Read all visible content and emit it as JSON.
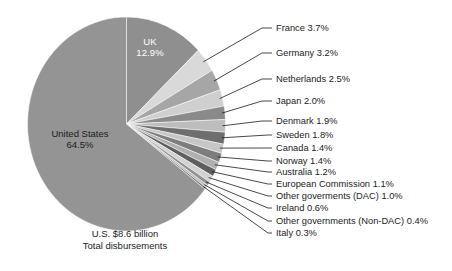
{
  "chart_data": {
    "type": "pie",
    "title": "",
    "center_labels": [
      {
        "name": "UK",
        "value_label": "12.9%",
        "value": 12.9
      },
      {
        "name": "United States",
        "value_label": "64.5%",
        "value": 64.5
      }
    ],
    "caption_line1": "U.S. $8.6 billion",
    "caption_line2": "Total disbursements",
    "legend_position": "callout-right",
    "categories": [
      "UK",
      "France",
      "Germany",
      "Netherlands",
      "Japan",
      "Denmark",
      "Sweden",
      "Canada",
      "Norway",
      "Australia",
      "European Commission",
      "Other goverments (DAC)",
      "Ireland",
      "Other governments (Non-DAC)",
      "Italy",
      "United States"
    ],
    "values": [
      12.9,
      3.7,
      3.2,
      2.5,
      2.0,
      1.9,
      1.8,
      1.4,
      1.4,
      1.2,
      1.1,
      1.0,
      0.6,
      0.4,
      0.3,
      64.5
    ],
    "slices": [
      {
        "name": "UK",
        "value": 12.9,
        "label": "UK 12.9%",
        "color": "#8f8f8f",
        "inside_label": true
      },
      {
        "name": "France",
        "value": 3.7,
        "label": "France 3.7%",
        "color": "#d9d9d9",
        "inside_label": false
      },
      {
        "name": "Germany",
        "value": 3.2,
        "label": "Germany 3.2%",
        "color": "#a6a6a6",
        "inside_label": false
      },
      {
        "name": "Netherlands",
        "value": 2.5,
        "label": "Netherlands 2.5%",
        "color": "#cfcfcf",
        "inside_label": false
      },
      {
        "name": "Japan",
        "value": 2.0,
        "label": "Japan 2.0%",
        "color": "#8a8a8a",
        "inside_label": false
      },
      {
        "name": "Denmark",
        "value": 1.9,
        "label": "Denmark 1.9%",
        "color": "#bdbdbd",
        "inside_label": false
      },
      {
        "name": "Sweden",
        "value": 1.8,
        "label": "Sweden 1.8%",
        "color": "#6e6e6e",
        "inside_label": false
      },
      {
        "name": "Canada",
        "value": 1.4,
        "label": "Canada 1.4%",
        "color": "#c6c6c6",
        "inside_label": false
      },
      {
        "name": "Norway",
        "value": 1.4,
        "label": "Norway 1.4%",
        "color": "#7d7d7d",
        "inside_label": false
      },
      {
        "name": "Australia",
        "value": 1.2,
        "label": "Australia 1.2%",
        "color": "#b0b0b0",
        "inside_label": false
      },
      {
        "name": "European Commission",
        "value": 1.1,
        "label": "European Commission 1.1%",
        "color": "#5f5f5f",
        "inside_label": false
      },
      {
        "name": "Other goverments (DAC)",
        "value": 1.0,
        "label": "Other goverments (DAC) 1.0%",
        "color": "#d2d2d2",
        "inside_label": false
      },
      {
        "name": "Ireland",
        "value": 0.6,
        "label": "Ireland 0.6%",
        "color": "#909090",
        "inside_label": false
      },
      {
        "name": "Other governments (Non-DAC)",
        "value": 0.4,
        "label": "Other governments (Non-DAC) 0.4%",
        "color": "#bbbbbb",
        "inside_label": false
      },
      {
        "name": "Italy",
        "value": 0.3,
        "label": "Italy 0.3%",
        "color": "#747474",
        "inside_label": false
      },
      {
        "name": "United States",
        "value": 64.5,
        "label": "United States 64.5%",
        "color": "#949494",
        "inside_label": true
      }
    ],
    "callout_labels": [
      "France 3.7%",
      "Germany 3.2%",
      "Netherlands 2.5%",
      "Japan 2.0%",
      "Denmark 1.9%",
      "Sweden 1.8%",
      "Canada 1.4%",
      "Norway 1.4%",
      "Australia 1.2%",
      "European Commission 1.1%",
      "Other goverments (DAC) 1.0%",
      "Ireland 0.6%",
      "Other governments (Non-DAC) 0.4%",
      "Italy 0.3%"
    ]
  }
}
